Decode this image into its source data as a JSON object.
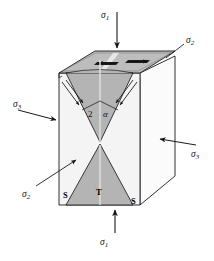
{
  "figure": {
    "background_color": "#ffffff",
    "line_color": "#1a1a1a",
    "top_face_fill": "#b9b9b9",
    "cone_fill": "#b0b0b0",
    "front_face_fill": "#f2f2f2",
    "right_face_fill": "#fbfbfb",
    "slot_fill": "#1c1c1c"
  },
  "labels": {
    "sigma1_top": {
      "symbol": "σ",
      "subscript": "1",
      "text": "σ₁"
    },
    "sigma1_bottom": {
      "symbol": "σ",
      "subscript": "1",
      "text": "σ₁"
    },
    "sigma2_topright": {
      "symbol": "σ",
      "subscript": "2",
      "text": "σ₂"
    },
    "sigma2_bottomleft": {
      "symbol": "σ",
      "subscript": "2",
      "text": "σ₂"
    },
    "sigma3_left": {
      "symbol": "σ",
      "subscript": "3",
      "text": "σ₃"
    },
    "sigma3_right": {
      "symbol": "σ",
      "subscript": "3",
      "text": "σ₃"
    },
    "angle_number": "2",
    "angle_greek": "α",
    "shear_left": "S",
    "shear_right": "S",
    "tension": "T"
  },
  "annotations": {
    "sigma1_top_arrow": "downward arrow onto top face",
    "sigma1_bottom_arrow": "upward arrow onto bottom face",
    "sigma3_left_arrow": "rightward arrow onto left face",
    "sigma3_right_arrow": "leftward arrow onto right face",
    "sigma2_topright_leader": "leader line to top-right edge",
    "sigma2_bottomleft_leader": "leader arrow to front-left face",
    "top_slot_arrows": "two opposed outward arrows in dark slots on the top face",
    "shear_arrows": "double-line shear arrows along upper cone flanks"
  }
}
